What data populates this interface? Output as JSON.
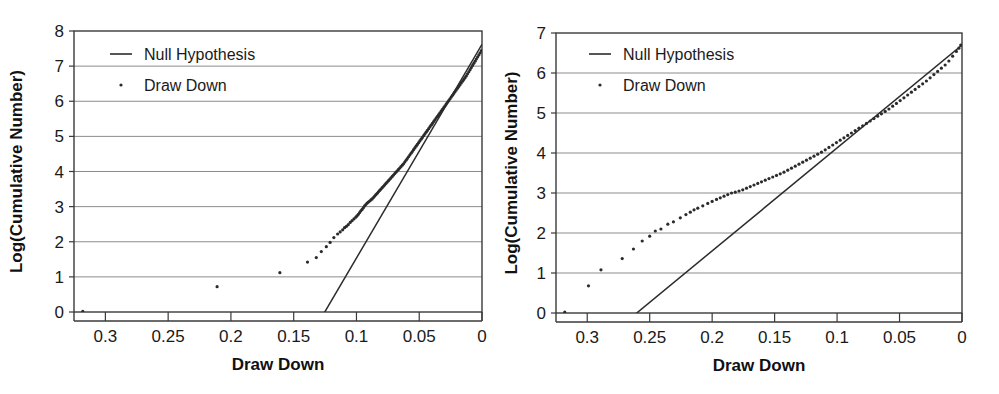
{
  "chart_data": [
    {
      "id": "left",
      "type": "scatter",
      "title": "",
      "xlabel": "Draw Down",
      "ylabel": "Log(Cumulative Number)",
      "xlim": [
        0.325,
        0.0
      ],
      "ylim": [
        0,
        8
      ],
      "x_reversed": true,
      "xticks": [
        0.3,
        0.25,
        0.2,
        0.15,
        0.1,
        0.05,
        0
      ],
      "xtick_labels": [
        "0.3",
        "0.25",
        "0.2",
        "0.15",
        "0.1",
        "0.05",
        "0"
      ],
      "yticks": [
        0,
        1,
        2,
        3,
        4,
        5,
        6,
        7,
        8
      ],
      "ytick_labels": [
        "0",
        "1",
        "2",
        "3",
        "4",
        "5",
        "6",
        "7",
        "8"
      ],
      "grid": "horizontal",
      "legend_position": "top-left",
      "legend": [
        {
          "label": "Null Hypothesis",
          "marker": "line"
        },
        {
          "label": "Draw Down",
          "marker": "dot"
        }
      ],
      "series": [
        {
          "name": "Null Hypothesis",
          "marker": "line",
          "x": [
            0.131,
            0.0
          ],
          "y": [
            -0.35,
            7.62
          ]
        },
        {
          "name": "Draw Down",
          "marker": "dot",
          "x": [
            0.318,
            0.211,
            0.161,
            0.139,
            0.132,
            0.128,
            0.124,
            0.121,
            0.118,
            0.115,
            0.113,
            0.111,
            0.1095,
            0.108,
            0.1065,
            0.105,
            0.1035,
            0.102,
            0.1005,
            0.0995,
            0.0985,
            0.0975,
            0.0965,
            0.0955,
            0.0945,
            0.0935,
            0.0925,
            0.0915,
            0.0905,
            0.0895,
            0.0885,
            0.0875,
            0.0865,
            0.0855,
            0.0845,
            0.0835,
            0.0825,
            0.0815,
            0.0805,
            0.0795,
            0.0785,
            0.0775,
            0.0765,
            0.0755,
            0.0745,
            0.0735,
            0.0725,
            0.0715,
            0.0705,
            0.0695,
            0.0685,
            0.0675,
            0.0665,
            0.0655,
            0.0645,
            0.0635,
            0.0625,
            0.0615,
            0.0605,
            0.0595,
            0.0585,
            0.0575,
            0.0565,
            0.0555,
            0.0545,
            0.0535,
            0.0525,
            0.0515,
            0.0505,
            0.0495,
            0.0485,
            0.0475,
            0.0465,
            0.0455,
            0.0445,
            0.0435,
            0.0425,
            0.0415,
            0.0405,
            0.0395,
            0.0385,
            0.0375,
            0.0365,
            0.0355,
            0.0345,
            0.0335,
            0.0325,
            0.0315,
            0.0305,
            0.0295,
            0.0285,
            0.0275,
            0.0265,
            0.0255,
            0.0245,
            0.0235,
            0.0225,
            0.0215,
            0.0205,
            0.0195,
            0.0185,
            0.0175,
            0.0165,
            0.0155,
            0.0145,
            0.0135,
            0.0125,
            0.0115,
            0.0105,
            0.0095,
            0.0085,
            0.0075,
            0.0065,
            0.0055,
            0.0045,
            0.0035,
            0.0025,
            0.0015,
            0.0005
          ],
          "y": [
            0.02,
            0.72,
            1.12,
            1.42,
            1.55,
            1.72,
            1.86,
            1.98,
            2.12,
            2.22,
            2.28,
            2.34,
            2.4,
            2.44,
            2.49,
            2.55,
            2.6,
            2.65,
            2.7,
            2.74,
            2.78,
            2.83,
            2.88,
            2.92,
            2.97,
            3.02,
            3.06,
            3.1,
            3.13,
            3.16,
            3.19,
            3.22,
            3.26,
            3.3,
            3.34,
            3.38,
            3.42,
            3.46,
            3.5,
            3.54,
            3.58,
            3.62,
            3.66,
            3.7,
            3.74,
            3.78,
            3.82,
            3.86,
            3.9,
            3.94,
            3.98,
            4.02,
            4.06,
            4.1,
            4.14,
            4.18,
            4.22,
            4.27,
            4.32,
            4.37,
            4.42,
            4.47,
            4.52,
            4.57,
            4.62,
            4.67,
            4.72,
            4.77,
            4.82,
            4.87,
            4.92,
            4.97,
            5.02,
            5.07,
            5.12,
            5.17,
            5.22,
            5.27,
            5.32,
            5.37,
            5.42,
            5.47,
            5.52,
            5.57,
            5.62,
            5.67,
            5.72,
            5.77,
            5.82,
            5.87,
            5.92,
            5.97,
            6.02,
            6.07,
            6.12,
            6.17,
            6.22,
            6.27,
            6.32,
            6.37,
            6.42,
            6.47,
            6.52,
            6.57,
            6.62,
            6.67,
            6.72,
            6.78,
            6.84,
            6.9,
            6.96,
            7.02,
            7.08,
            7.14,
            7.2,
            7.26,
            7.32,
            7.38,
            7.44,
            7.5,
            7.56,
            7.62
          ]
        }
      ]
    },
    {
      "id": "right",
      "type": "scatter",
      "title": "",
      "xlabel": "Draw Down",
      "ylabel": "Log(Cumulative Number)",
      "xlim": [
        0.325,
        0.0
      ],
      "ylim": [
        0,
        7
      ],
      "x_reversed": true,
      "xticks": [
        0.3,
        0.25,
        0.2,
        0.15,
        0.1,
        0.05,
        0
      ],
      "xtick_labels": [
        "0.3",
        "0.25",
        "0.2",
        "0.15",
        "0.1",
        "0.05",
        "0"
      ],
      "yticks": [
        0,
        1,
        2,
        3,
        4,
        5,
        6,
        7
      ],
      "ytick_labels": [
        "0",
        "1",
        "2",
        "3",
        "4",
        "5",
        "6",
        "7"
      ],
      "grid": "horizontal",
      "legend_position": "top-left",
      "legend": [
        {
          "label": "Null Hypothesis",
          "marker": "line"
        },
        {
          "label": "Draw Down",
          "marker": "dot"
        }
      ],
      "series": [
        {
          "name": "Null Hypothesis",
          "marker": "line",
          "x": [
            0.272,
            0.0
          ],
          "y": [
            -0.3,
            6.7
          ]
        },
        {
          "name": "Draw Down",
          "marker": "dot",
          "x": [
            0.318,
            0.299,
            0.289,
            0.272,
            0.263,
            0.256,
            0.25,
            0.2455,
            0.241,
            0.2355,
            0.231,
            0.2255,
            0.221,
            0.2175,
            0.2145,
            0.2115,
            0.2075,
            0.2035,
            0.2,
            0.1965,
            0.1935,
            0.1905,
            0.1875,
            0.1845,
            0.1815,
            0.1785,
            0.1755,
            0.1725,
            0.1695,
            0.1665,
            0.1635,
            0.1605,
            0.1575,
            0.1545,
            0.1515,
            0.1485,
            0.1455,
            0.1425,
            0.1395,
            0.1365,
            0.1335,
            0.1305,
            0.1275,
            0.1245,
            0.1215,
            0.1185,
            0.1155,
            0.1125,
            0.1095,
            0.1065,
            0.1035,
            0.1005,
            0.0975,
            0.0945,
            0.0915,
            0.0885,
            0.0855,
            0.0825,
            0.0795,
            0.0765,
            0.0735,
            0.0705,
            0.0675,
            0.0645,
            0.0615,
            0.0585,
            0.0555,
            0.0525,
            0.0495,
            0.0465,
            0.0435,
            0.0405,
            0.0375,
            0.0345,
            0.0315,
            0.0285,
            0.0255,
            0.0225,
            0.0195,
            0.0165,
            0.0135,
            0.0105,
            0.0075,
            0.0045,
            0.0025,
            0.001
          ],
          "y": [
            0.02,
            0.68,
            1.08,
            1.36,
            1.6,
            1.8,
            1.92,
            2.05,
            2.1,
            2.22,
            2.28,
            2.38,
            2.46,
            2.52,
            2.58,
            2.62,
            2.68,
            2.74,
            2.79,
            2.84,
            2.88,
            2.92,
            2.96,
            3.0,
            3.02,
            3.05,
            3.08,
            3.12,
            3.16,
            3.2,
            3.24,
            3.28,
            3.32,
            3.36,
            3.4,
            3.44,
            3.48,
            3.52,
            3.57,
            3.62,
            3.67,
            3.72,
            3.77,
            3.82,
            3.87,
            3.92,
            3.97,
            4.02,
            4.08,
            4.14,
            4.2,
            4.26,
            4.32,
            4.38,
            4.44,
            4.5,
            4.56,
            4.62,
            4.68,
            4.74,
            4.8,
            4.86,
            4.92,
            4.98,
            5.04,
            5.1,
            5.17,
            5.24,
            5.31,
            5.38,
            5.45,
            5.52,
            5.59,
            5.66,
            5.73,
            5.8,
            5.88,
            5.96,
            6.04,
            6.12,
            6.2,
            6.3,
            6.42,
            6.54,
            6.62,
            6.7
          ]
        }
      ]
    }
  ],
  "panels": [
    {
      "name": "left-panel",
      "xlabel": "Draw Down",
      "ylabel": "Log(Cumulative Number)",
      "legend_null": "Null Hypothesis",
      "legend_draw": "Draw Down"
    },
    {
      "name": "right-panel",
      "xlabel": "Draw Down",
      "ylabel": "Log(Cumulative Number)",
      "legend_null": "Null Hypothesis",
      "legend_draw": "Draw Down"
    }
  ],
  "colors": {
    "background": "#ffffff",
    "gridline": "#8c8c8c",
    "frame": "#3a3a3a",
    "line": "#2b2b2b",
    "marker": "#2b2b2b",
    "text": "#1a1a1a"
  }
}
